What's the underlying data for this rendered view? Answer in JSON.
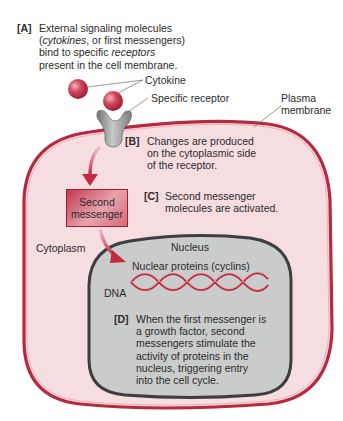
{
  "steps": {
    "A": {
      "tag": "[A]",
      "lines": [
        "External signaling molecules",
        "(cytokines, or first messengers)",
        "bind to specific receptors",
        "present in the cell membrane."
      ]
    },
    "B": {
      "tag": "[B]",
      "lines": [
        "Changes are produced",
        "on the cytoplasmic side",
        "of the receptor."
      ]
    },
    "C": {
      "tag": "[C]",
      "lines": [
        "Second messenger",
        "molecules are activated."
      ]
    },
    "D": {
      "tag": "[D]",
      "lines": [
        "When the first messenger is",
        "a growth factor, second",
        "messengers stimulate the",
        "activity of proteins in the",
        "nucleus, triggering entry",
        "into the cell cycle."
      ]
    }
  },
  "labels": {
    "cytokine": "Cytokine",
    "specific_receptor": "Specific receptor",
    "plasma_membrane_1": "Plasma",
    "plasma_membrane_2": "membrane",
    "second_messenger_1": "Second",
    "second_messenger_2": "messenger",
    "cytoplasm": "Cytoplasm",
    "nucleus": "Nucleus",
    "nuclear_proteins": "Nuclear proteins (cyclins)",
    "dna": "DNA"
  },
  "colors": {
    "membrane": "#b8283f",
    "cytoplasm_fill": "#f6dde0",
    "nucleus_fill": "#c9cccb",
    "nucleus_border": "#3e3e40",
    "cytokine": "#c8344a",
    "receptor": "#8d9190",
    "dna": "#b8283f"
  }
}
